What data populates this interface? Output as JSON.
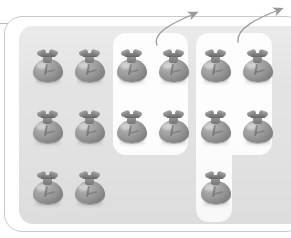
{
  "figure": {
    "type": "set-partition-diagram",
    "total_items": 15,
    "item_icon": "money-bag-icon",
    "colors": {
      "page_background": "#ffffff",
      "set_region": "#e2e2e2",
      "group_highlight": "#fdfdfd",
      "frame_border": "#c9c9c9",
      "item_fill": "#9d9d9d",
      "arrow": "#9a9a9a",
      "rule": "#b9b9b9"
    }
  },
  "grid": {
    "rows": 3,
    "columns": 6,
    "cell_width": 42,
    "cell_height": 61,
    "origin_x": 32,
    "origin_y": 50,
    "occupied": [
      [
        1,
        1,
        1,
        1,
        1,
        1
      ],
      [
        1,
        1,
        1,
        1,
        1,
        1
      ],
      [
        1,
        1,
        0,
        0,
        1,
        0
      ]
    ]
  },
  "items": [
    {
      "id": "bag-r1c1",
      "row": 1,
      "col": 1,
      "x": 32,
      "y": 50,
      "group": "none"
    },
    {
      "id": "bag-r1c2",
      "row": 1,
      "col": 2,
      "x": 74,
      "y": 50,
      "group": "none"
    },
    {
      "id": "bag-r1c3",
      "row": 1,
      "col": 3,
      "x": 116,
      "y": 50,
      "group": "a"
    },
    {
      "id": "bag-r1c4",
      "row": 1,
      "col": 4,
      "x": 158,
      "y": 50,
      "group": "a"
    },
    {
      "id": "bag-r1c5",
      "row": 1,
      "col": 5,
      "x": 200,
      "y": 50,
      "group": "b"
    },
    {
      "id": "bag-r1c6",
      "row": 1,
      "col": 6,
      "x": 242,
      "y": 50,
      "group": "b"
    },
    {
      "id": "bag-r2c1",
      "row": 2,
      "col": 1,
      "x": 32,
      "y": 111,
      "group": "none"
    },
    {
      "id": "bag-r2c2",
      "row": 2,
      "col": 2,
      "x": 74,
      "y": 111,
      "group": "none"
    },
    {
      "id": "bag-r2c3",
      "row": 2,
      "col": 3,
      "x": 116,
      "y": 111,
      "group": "a"
    },
    {
      "id": "bag-r2c4",
      "row": 2,
      "col": 4,
      "x": 158,
      "y": 111,
      "group": "a"
    },
    {
      "id": "bag-r2c5",
      "row": 2,
      "col": 5,
      "x": 200,
      "y": 111,
      "group": "b"
    },
    {
      "id": "bag-r2c6",
      "row": 2,
      "col": 6,
      "x": 242,
      "y": 111,
      "group": "b"
    },
    {
      "id": "bag-r3c1",
      "row": 3,
      "col": 1,
      "x": 32,
      "y": 172,
      "group": "none"
    },
    {
      "id": "bag-r3c2",
      "row": 3,
      "col": 2,
      "x": 74,
      "y": 172,
      "group": "none"
    },
    {
      "id": "bag-r3c5",
      "row": 3,
      "col": 5,
      "x": 200,
      "y": 172,
      "group": "b"
    }
  ],
  "groups": [
    {
      "id": "a",
      "name": "group-a",
      "shape": "rectangle",
      "count": 4,
      "members": [
        "bag-r1c3",
        "bag-r1c4",
        "bag-r2c3",
        "bag-r2c4"
      ]
    },
    {
      "id": "b",
      "name": "group-b",
      "shape": "L-shape",
      "count": 5,
      "members": [
        "bag-r1c5",
        "bag-r1c6",
        "bag-r2c5",
        "bag-r2c6",
        "bag-r3c5"
      ]
    }
  ],
  "arrows": [
    {
      "id": "arrow-to-group-a",
      "from": "group-a",
      "direction": "up-right",
      "path": "M 157 45 C 152 32 175 22 196 13"
    },
    {
      "id": "arrow-to-group-b",
      "from": "group-b",
      "direction": "up-right",
      "path": "M 238 42 C 236 28 258 18 281 9"
    }
  ]
}
